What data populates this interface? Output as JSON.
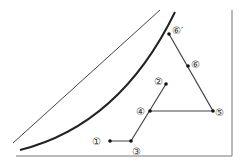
{
  "diagram": {
    "points": [
      {
        "id": "p1",
        "label": "①",
        "x": 110,
        "y": 141,
        "lx": 92,
        "ly": 145
      },
      {
        "id": "p2",
        "label": "②",
        "x": 166,
        "y": 84,
        "lx": 148,
        "ly": 85
      },
      {
        "id": "p3",
        "label": "③",
        "x": 131,
        "y": 141,
        "lx": 132,
        "ly": 155
      },
      {
        "id": "p4",
        "label": "④",
        "x": 150,
        "y": 111,
        "lx": 134,
        "ly": 115
      },
      {
        "id": "p5",
        "label": "⑤",
        "x": 213,
        "y": 111,
        "lx": 216,
        "ly": 116
      },
      {
        "id": "p6",
        "label": "⑥",
        "x": 188,
        "y": 66,
        "lx": 191,
        "ly": 67
      },
      {
        "id": "p6p",
        "label": "⑥′",
        "x": 169,
        "y": 34,
        "lx": 172,
        "ly": 33
      }
    ]
  }
}
